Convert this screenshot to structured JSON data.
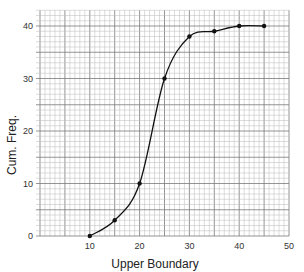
{
  "chart_data": {
    "type": "line",
    "title": "",
    "xlabel": "Upper Boundary",
    "ylabel": "Cum. Freq.",
    "x": [
      10,
      15,
      20,
      25,
      30,
      35,
      40,
      45
    ],
    "series": [
      {
        "name": "Cumulative frequency",
        "values": [
          0,
          3,
          10,
          30,
          38,
          39,
          40,
          40
        ]
      }
    ],
    "xlim": [
      0,
      50
    ],
    "ylim": [
      0,
      43
    ],
    "x_ticks": [
      10,
      20,
      30,
      40,
      50
    ],
    "y_ticks": [
      0,
      10,
      20,
      30,
      40
    ],
    "grid": true,
    "smooth_curve": true,
    "markers": true,
    "legend": "none"
  },
  "colors": {
    "grid_minor": "#b8b8b8",
    "grid_major": "#7a7a7a",
    "curve": "#111111"
  }
}
